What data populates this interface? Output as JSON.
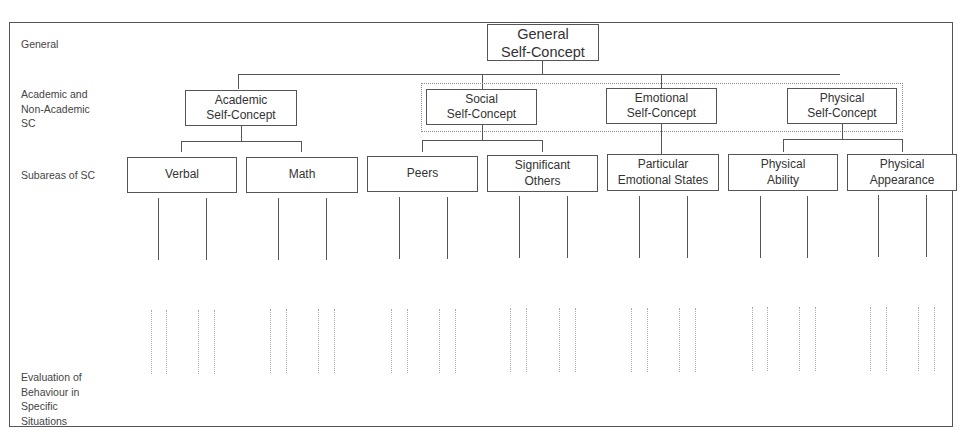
{
  "diagram": {
    "levels": [
      {
        "id": "general",
        "label": "General"
      },
      {
        "id": "academic_nonacademic",
        "label": "Academic and\nNon-Academic\nSC"
      },
      {
        "id": "subareas",
        "label": "Subareas of SC"
      },
      {
        "id": "evaluation",
        "label": "Evaluation of\nBehaviour in\nSpecific\nSituations"
      }
    ],
    "root": {
      "label": "General\nSelf-Concept"
    },
    "domains": [
      {
        "label": "Academic\nSelf-Concept",
        "children": [
          "Verbal",
          "Math"
        ]
      },
      {
        "label": "Social\nSelf-Concept",
        "children": [
          "Peers",
          "Significant\nOthers"
        ]
      },
      {
        "label": "Emotional\nSelf-Concept",
        "children": [
          "Particular\nEmotional States"
        ]
      },
      {
        "label": "Physical\nSelf-Concept",
        "children": [
          "Physical\nAbility",
          "Physical\nAppearance"
        ]
      }
    ],
    "subareas": [
      {
        "label": "Verbal"
      },
      {
        "label": "Math"
      },
      {
        "label": "Peers"
      },
      {
        "label": "Significant\nOthers"
      },
      {
        "label": "Particular\nEmotional States"
      },
      {
        "label": "Physical\nAbility"
      },
      {
        "label": "Physical\nAppearance"
      }
    ],
    "non_academic_group": {
      "style": "dotted",
      "members": [
        "Social",
        "Emotional",
        "Physical"
      ]
    }
  }
}
